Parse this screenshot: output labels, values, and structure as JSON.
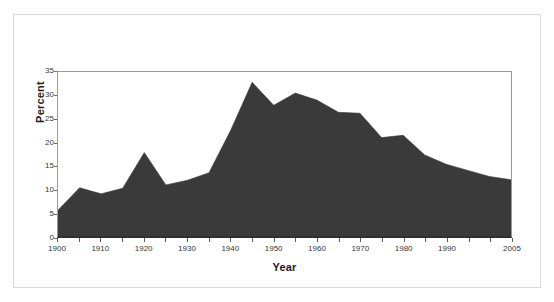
{
  "chart_data": {
    "type": "area",
    "title": "",
    "xlabel": "Year",
    "ylabel": "Percent",
    "xlim": [
      1900,
      2005
    ],
    "ylim": [
      0,
      35
    ],
    "grid": false,
    "legend": "none",
    "fill_color": "#3a3a3a",
    "x": [
      1900,
      1905,
      1910,
      1915,
      1920,
      1925,
      1930,
      1935,
      1940,
      1945,
      1950,
      1955,
      1960,
      1965,
      1970,
      1975,
      1980,
      1985,
      1990,
      1995,
      2000,
      2005
    ],
    "values": [
      5.5,
      10.3,
      9.0,
      10.2,
      17.8,
      10.9,
      11.9,
      13.5,
      22.5,
      32.8,
      27.9,
      30.5,
      29.0,
      26.4,
      26.2,
      21.0,
      21.5,
      17.3,
      15.3,
      14.0,
      12.7,
      12.0
    ],
    "x_tick_values": [
      1900,
      1905,
      1910,
      1915,
      1920,
      1925,
      1930,
      1935,
      1940,
      1945,
      1950,
      1955,
      1960,
      1965,
      1970,
      1975,
      1980,
      1985,
      1990,
      1995,
      2000,
      2005
    ],
    "x_tick_labels": [
      "1900",
      "",
      "1910",
      "",
      "1920",
      "",
      "1930",
      "",
      "1940",
      "",
      "1950",
      "",
      "1960",
      "",
      "1970",
      "",
      "1980",
      "",
      "1990",
      "",
      "",
      "2005"
    ],
    "y_tick_values": [
      0,
      5,
      10,
      15,
      20,
      25,
      30,
      35
    ],
    "y_tick_labels": [
      "0",
      "5",
      "10",
      "15",
      "20",
      "25",
      "30",
      "35"
    ]
  }
}
